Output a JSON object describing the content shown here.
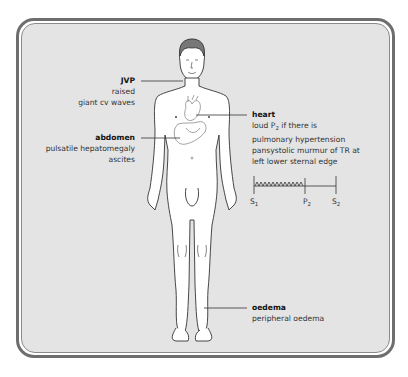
{
  "diagram": {
    "labels": {
      "jvp": {
        "heading": "JVP",
        "lines": [
          "raised",
          "giant cv waves"
        ]
      },
      "abdomen": {
        "heading": "abdomen",
        "lines": [
          "pulsatile hepatomegaly",
          "ascites"
        ]
      },
      "heart": {
        "heading": "heart",
        "line1_prefix": "loud P",
        "line1_sub": "2",
        "line1_suffix": " if there is",
        "lines": [
          "pulmonary hypertension",
          "pansystolic murmur of TR at",
          "left lower sternal edge"
        ]
      },
      "oedema": {
        "heading": "oedema",
        "lines": [
          "peripheral oedema"
        ]
      }
    },
    "phonocardiogram": {
      "markers": [
        {
          "label": "S",
          "sub": "1"
        },
        {
          "label": "P",
          "sub": "2"
        },
        {
          "label": "S",
          "sub": "2"
        }
      ],
      "murmur": "pansystolic"
    },
    "colors": {
      "panel": "#e4e4e4",
      "border": "#6e6e6e",
      "figure_fill": "#ffffff",
      "line": "#333333"
    }
  }
}
